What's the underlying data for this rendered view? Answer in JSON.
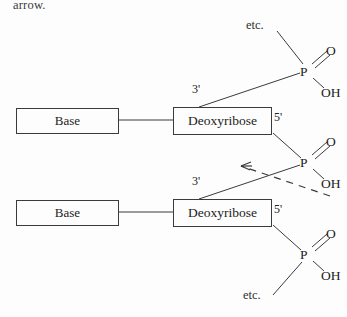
{
  "figure": {
    "caption_fragment": "arrow.",
    "background_color": "#fdfdfd",
    "stroke_color": "#3b3b3b",
    "text_color": "#222222"
  },
  "labels": {
    "base": "Base",
    "deoxyribose": "Deoxyribose",
    "three_prime": "3'",
    "five_prime": "5'",
    "oxygen": "O",
    "hydroxyl": "OH",
    "phosphorus": "P",
    "etc": "etc."
  },
  "nucleotides": [
    {
      "id": "upper",
      "base_label": "Base",
      "sugar_label": "Deoxyribose",
      "three_prime_label": "3'",
      "five_prime_label": "5'"
    },
    {
      "id": "lower",
      "base_label": "Base",
      "sugar_label": "Deoxyribose",
      "three_prime_label": "3'",
      "five_prime_label": "5'"
    }
  ],
  "phosphates": [
    {
      "id": "top",
      "center": "P",
      "double_bond_atom": "O",
      "hydroxyl": "OH",
      "terminator": "etc."
    },
    {
      "id": "middle",
      "center": "P",
      "double_bond_atom": "O",
      "hydroxyl": "OH",
      "terminator": ""
    },
    {
      "id": "bottom",
      "center": "P",
      "double_bond_atom": "O",
      "hydroxyl": "OH",
      "terminator": "etc."
    }
  ],
  "annotation": {
    "style": "dashed-arrow",
    "direction": "points-left",
    "description": "dashed arrow pointing at the 3'-5' phosphodiester linkage"
  }
}
